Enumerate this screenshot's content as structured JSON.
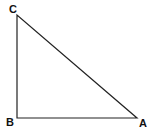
{
  "diagram": {
    "type": "right-triangle",
    "stroke_color": "#222222",
    "vertices": [
      {
        "id": "C",
        "label": "C",
        "x": 17,
        "y": 15,
        "label_x": 9,
        "label_y": 13
      },
      {
        "id": "B",
        "label": "B",
        "x": 17,
        "y": 118,
        "label_x": 6,
        "label_y": 126
      },
      {
        "id": "A",
        "label": "A",
        "x": 137,
        "y": 118,
        "label_x": 139,
        "label_y": 127
      }
    ],
    "edges": [
      {
        "from": "C",
        "to": "B"
      },
      {
        "from": "B",
        "to": "A"
      },
      {
        "from": "A",
        "to": "C"
      }
    ],
    "right_angle_at": "B"
  }
}
